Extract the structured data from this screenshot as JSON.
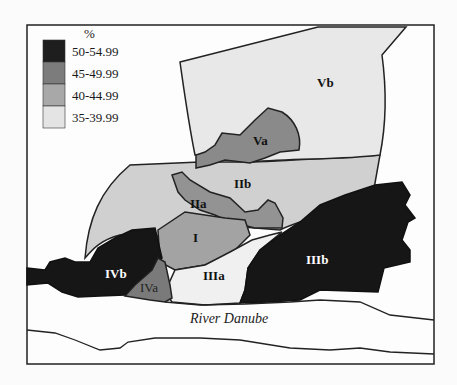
{
  "map": {
    "title": "Zones map (percentage classes)",
    "river_label": "River Danube",
    "legend": {
      "unit": "%",
      "items": [
        {
          "label": "50-54.99",
          "color": "#1e1e1e"
        },
        {
          "label": "45-49.99",
          "color": "#7c7c7c"
        },
        {
          "label": "40-44.99",
          "color": "#a8a8a8"
        },
        {
          "label": "35-39.99",
          "color": "#e4e4e4"
        }
      ]
    },
    "zones": [
      {
        "id": "Vb",
        "label": "Vb",
        "class": "35-39.99"
      },
      {
        "id": "Va",
        "label": "Va",
        "class": "45-49.99"
      },
      {
        "id": "IIb",
        "label": "IIb",
        "class": "40-44.99"
      },
      {
        "id": "IIa",
        "label": "IIa",
        "class": "45-49.99"
      },
      {
        "id": "I",
        "label": "I",
        "class": "45-49.99"
      },
      {
        "id": "IIIa",
        "label": "IIIa",
        "class": "35-39.99"
      },
      {
        "id": "IIIb",
        "label": "IIIb",
        "class": "50-54.99"
      },
      {
        "id": "IVa",
        "label": "IVa",
        "class": "45-49.99"
      },
      {
        "id": "IVb",
        "label": "IVb",
        "class": "50-54.99"
      }
    ]
  }
}
